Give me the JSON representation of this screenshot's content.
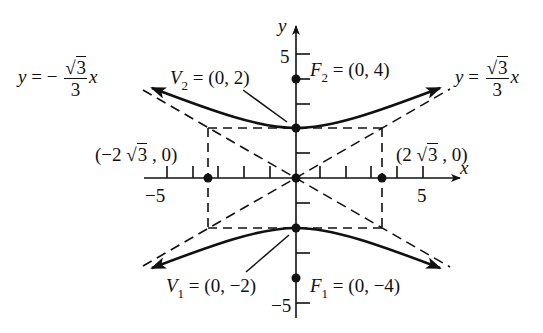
{
  "figure": {
    "type": "hyperbola-graph",
    "equation_orientation": "vertical transverse axis",
    "axes": {
      "x_label": "x",
      "y_label": "y",
      "x_tick_labels": {
        "neg": "−5",
        "pos": "5"
      },
      "y_tick_labels": {
        "pos": "5",
        "neg": "−5"
      },
      "x_range": [
        -6,
        6.5
      ],
      "y_range": [
        -6,
        7
      ]
    },
    "asymptotes": {
      "left": {
        "lhs": "y = −",
        "num": "3",
        "den": "3",
        "var": "x",
        "slope": -0.577
      },
      "right": {
        "lhs": "y = ",
        "num": "3",
        "den": "3",
        "var": "x",
        "slope": 0.577
      }
    },
    "points": {
      "v2": {
        "name": "V",
        "sub": "2",
        "text": " = (0, 2)",
        "x": 0,
        "y": 2
      },
      "f2": {
        "name": "F",
        "sub": "2",
        "text": " = (0, 4)",
        "x": 0,
        "y": 4
      },
      "v1": {
        "name": "V",
        "sub": "1",
        "text": " = (0, −2)",
        "x": 0,
        "y": -2
      },
      "f1": {
        "name": "F",
        "sub": "1",
        "text": " = (0, −4)",
        "x": 0,
        "y": -4
      },
      "left_pt": {
        "pre": "(−2 ",
        "rad": "3",
        "post": " , 0)",
        "x": -3.464,
        "y": 0
      },
      "right_pt": {
        "pre": "(2 ",
        "rad": "3",
        "post": " , 0)",
        "x": 3.464,
        "y": 0
      }
    },
    "central_box": {
      "x_min": -3.464,
      "x_max": 3.464,
      "y_min": -2,
      "y_max": 2
    }
  }
}
